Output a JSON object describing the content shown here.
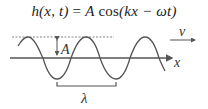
{
  "equation": {
    "lhs": "h(x, t)",
    "equals": " = ",
    "amp": "A",
    "func": " cos",
    "arg": "(kx − ωt)"
  },
  "labels": {
    "amplitude": "A",
    "velocity": "v",
    "axis": "x",
    "wavelength": "λ"
  },
  "colors": {
    "stroke": "#555555",
    "dashed": "#777777",
    "text": "#222222"
  }
}
